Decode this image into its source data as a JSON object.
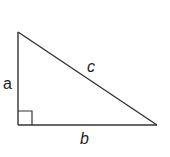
{
  "diagram": {
    "stroke_color": "#333333",
    "background": "#ffffff",
    "vertices": {
      "top": [
        18,
        32
      ],
      "right_angle": [
        18,
        125
      ],
      "right": [
        157,
        125
      ]
    },
    "right_angle_marker": {
      "x": 18,
      "y": 111,
      "size": 14
    },
    "labels": {
      "a": "a",
      "b": "b",
      "c": "c"
    },
    "sides": [
      {
        "name": "a",
        "type": "leg",
        "orientation": "vertical"
      },
      {
        "name": "b",
        "type": "leg",
        "orientation": "horizontal"
      },
      {
        "name": "c",
        "type": "hypotenuse",
        "orientation": "diagonal"
      }
    ]
  }
}
